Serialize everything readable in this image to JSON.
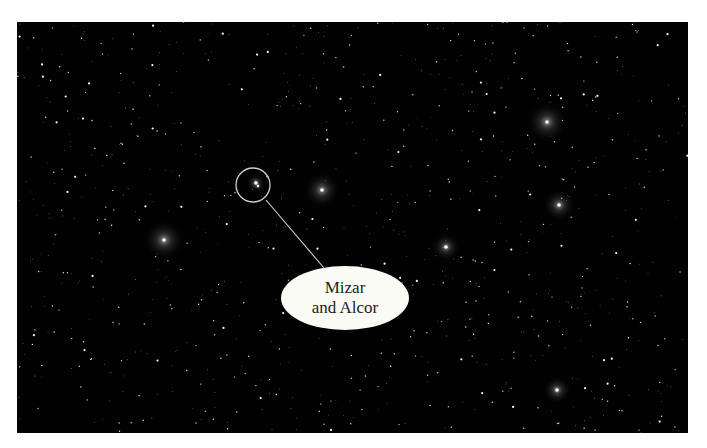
{
  "image": {
    "subject": "Big Dipper star field",
    "background_color": "#020202",
    "border_color": "#ffffff"
  },
  "label": {
    "line1": "Mizar",
    "line2": "and Alcor"
  },
  "highlight_circle": {
    "cx": 236,
    "cy": 163,
    "r": 17,
    "color": "#cfcfcf"
  },
  "pointer_line": {
    "x1": 249,
    "y1": 178,
    "x2": 307,
    "y2": 246,
    "color": "#cfcfcf"
  },
  "bright_stars": [
    {
      "name": "star-alkaid",
      "x": 147,
      "y": 218,
      "glow": 20
    },
    {
      "name": "star-mizar",
      "x": 239,
      "y": 161,
      "glow": 10
    },
    {
      "name": "star-alcor",
      "x": 241,
      "y": 164,
      "glow": 4
    },
    {
      "name": "star-alioth",
      "x": 305,
      "y": 168,
      "glow": 18
    },
    {
      "name": "star-megrez",
      "x": 429,
      "y": 225,
      "glow": 14
    },
    {
      "name": "star-dubhe",
      "x": 530,
      "y": 100,
      "glow": 20
    },
    {
      "name": "star-merak",
      "x": 542,
      "y": 183,
      "glow": 16
    },
    {
      "name": "star-bottom-right",
      "x": 540,
      "y": 368,
      "glow": 14
    }
  ]
}
